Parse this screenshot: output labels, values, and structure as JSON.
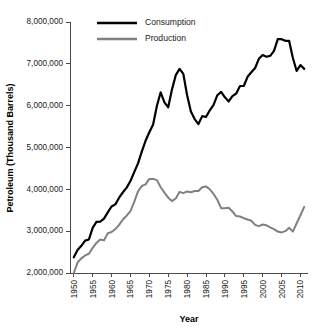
{
  "chart_data": {
    "type": "line",
    "title": "",
    "xlabel": "Year",
    "ylabel": "Petroleum (Thousand Barrels)",
    "xlim": [
      1949,
      2012
    ],
    "ylim": [
      2000000,
      8000000
    ],
    "grid": false,
    "legend_position": "top-center",
    "ytick_labels": [
      "8,000,000",
      "7,000,000",
      "6,000,000",
      "5,000,000",
      "4,000,000",
      "3,000,000",
      "2,000,000"
    ],
    "ytick_values": [
      8000000,
      7000000,
      6000000,
      5000000,
      4000000,
      3000000,
      2000000
    ],
    "xtick_labels": [
      "1950",
      "1955",
      "1960",
      "1965",
      "1970",
      "1975",
      "1980",
      "1985",
      "1990",
      "1995",
      "2000",
      "2005",
      "2010"
    ],
    "xtick_values": [
      1950,
      1955,
      1960,
      1965,
      1970,
      1975,
      1980,
      1985,
      1990,
      1995,
      2000,
      2005,
      2010
    ],
    "x": [
      1950,
      1951,
      1952,
      1953,
      1954,
      1955,
      1956,
      1957,
      1958,
      1959,
      1960,
      1961,
      1962,
      1963,
      1964,
      1965,
      1966,
      1967,
      1968,
      1969,
      1970,
      1971,
      1972,
      1973,
      1974,
      1975,
      1976,
      1977,
      1978,
      1979,
      1980,
      1981,
      1982,
      1983,
      1984,
      1985,
      1986,
      1987,
      1988,
      1989,
      1990,
      1991,
      1992,
      1993,
      1994,
      1995,
      1996,
      1997,
      1998,
      1999,
      2000,
      2001,
      2002,
      2003,
      2004,
      2005,
      2006,
      2007,
      2008,
      2009,
      2010,
      2011
    ],
    "series": [
      {
        "name": "Consumption",
        "color": "#000000",
        "values": [
          2375000,
          2550000,
          2650000,
          2775000,
          2800000,
          3080000,
          3220000,
          3230000,
          3300000,
          3450000,
          3590000,
          3640000,
          3800000,
          3930000,
          4040000,
          4200000,
          4410000,
          4620000,
          4900000,
          5160000,
          5365000,
          5550000,
          5990000,
          6320000,
          6080000,
          5960000,
          6390000,
          6730000,
          6880000,
          6760000,
          6250000,
          5860000,
          5680000,
          5560000,
          5750000,
          5730000,
          5890000,
          6020000,
          6250000,
          6330000,
          6200000,
          6100000,
          6230000,
          6290000,
          6470000,
          6470000,
          6690000,
          6800000,
          6900000,
          7120000,
          7210000,
          7170000,
          7190000,
          7310000,
          7590000,
          7590000,
          7550000,
          7550000,
          7140000,
          6830000,
          6970000,
          6880000
        ]
      },
      {
        "name": "Production",
        "color": "#808080",
        "values": [
          2000000,
          2250000,
          2350000,
          2420000,
          2460000,
          2600000,
          2720000,
          2800000,
          2780000,
          2950000,
          2980000,
          3050000,
          3150000,
          3280000,
          3370000,
          3480000,
          3700000,
          3950000,
          4080000,
          4120000,
          4250000,
          4250000,
          4220000,
          4050000,
          3920000,
          3800000,
          3720000,
          3780000,
          3940000,
          3910000,
          3950000,
          3930000,
          3960000,
          3960000,
          4050000,
          4070000,
          4000000,
          3890000,
          3750000,
          3550000,
          3550000,
          3560000,
          3470000,
          3360000,
          3350000,
          3310000,
          3280000,
          3250000,
          3150000,
          3120000,
          3160000,
          3140000,
          3090000,
          3050000,
          2990000,
          2970000,
          3000000,
          3080000,
          2990000,
          3190000,
          3380000,
          3580000
        ]
      }
    ]
  },
  "legend": {
    "entries": [
      {
        "label": "Consumption",
        "color": "#000000"
      },
      {
        "label": "Production",
        "color": "#808080"
      }
    ]
  }
}
